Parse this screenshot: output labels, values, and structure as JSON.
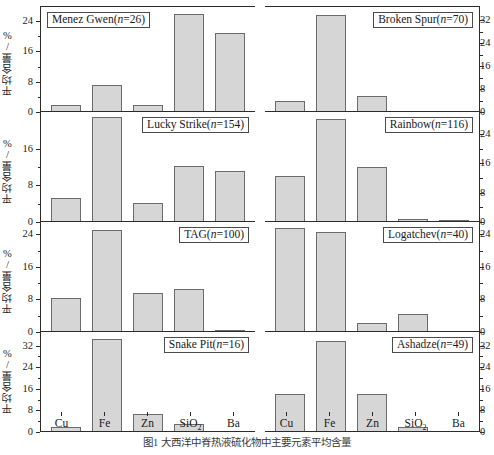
{
  "figure": {
    "ylabel": "平均含量/%",
    "caption": "图1  大西洋中脊热液硫化物中主要元素平均含量",
    "bar_fill": "#d6d6d6",
    "bar_edge": "#6b6b6b",
    "axis_color": "#2b2b2b"
  },
  "chart_data": {
    "type": "bar",
    "title": "图1  大西洋中脊热液硫化物中主要元素平均含量",
    "xlabel": "",
    "ylabel": "平均含量/%",
    "categories": [
      "Cu",
      "Fe",
      "Zn",
      "SiO2",
      "Ba"
    ],
    "grid": false,
    "legend": "none",
    "panels": [
      {
        "name": "Menez Gwen",
        "n": 26,
        "label": "Menez Gwen(n=26)",
        "position": "row1-left",
        "ylim": [
          0,
          28
        ],
        "yticks": [
          0,
          8,
          16,
          24
        ],
        "values": [
          1.5,
          7.0,
          1.5,
          26.0,
          21.0
        ]
      },
      {
        "name": "Broken Spur",
        "n": 70,
        "label": "Broken Spur(n=70)",
        "position": "row1-right",
        "ylim": [
          0,
          37
        ],
        "yticks": [
          0,
          8,
          16,
          24,
          32
        ],
        "values": [
          3.5,
          34.0,
          5.5,
          0.0,
          0.0
        ]
      },
      {
        "name": "Lucky Strike",
        "n": 154,
        "label": "Lucky Strike(n=154)",
        "position": "row2-left",
        "ylim": [
          0,
          24
        ],
        "yticks": [
          0,
          8,
          16
        ],
        "values": [
          5.0,
          23.0,
          4.0,
          12.2,
          11.0
        ]
      },
      {
        "name": "Rainbow",
        "n": 116,
        "label": "Rainbow(n=116)",
        "position": "row2-right",
        "ylim": [
          0,
          30
        ],
        "yticks": [
          0,
          8,
          16,
          24
        ],
        "values": [
          12.5,
          28.0,
          15.0,
          0.5,
          0.3
        ]
      },
      {
        "name": "TAG",
        "n": 100,
        "label": "TAG(n=100)",
        "position": "row3-left",
        "ylim": [
          0,
          27
        ],
        "yticks": [
          0,
          8,
          16,
          24
        ],
        "values": [
          8.2,
          25.0,
          9.5,
          10.5,
          0.3
        ]
      },
      {
        "name": "Logatchev",
        "n": 40,
        "label": "Logatchev(n=40)",
        "position": "row3-right",
        "ylim": [
          0,
          27
        ],
        "yticks": [
          0,
          8,
          16,
          24
        ],
        "values": [
          25.5,
          24.5,
          2.0,
          4.2,
          0.0
        ]
      },
      {
        "name": "Snake Pit",
        "n": 16,
        "label": "Snake Pit(n=16)",
        "position": "row4-left",
        "ylim": [
          0,
          37
        ],
        "yticks": [
          0,
          8,
          16,
          24,
          32
        ],
        "values": [
          1.5,
          34.5,
          6.5,
          2.5,
          0.0
        ]
      },
      {
        "name": "Ashadze",
        "n": 49,
        "label": "Ashadze(n=49)",
        "position": "row4-right",
        "ylim": [
          0,
          37
        ],
        "yticks": [
          0,
          8,
          16,
          24,
          32
        ],
        "values": [
          14.0,
          33.5,
          14.0,
          1.5,
          0.0
        ]
      }
    ]
  },
  "axes": {
    "x_categories": [
      "Cu",
      "Fe",
      "Zn",
      "SiO₂",
      "Ba"
    ]
  }
}
